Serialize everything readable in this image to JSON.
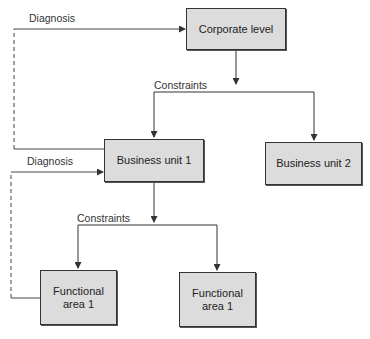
{
  "diagram": {
    "nodes": [
      {
        "id": "corporate",
        "label": "Corporate level"
      },
      {
        "id": "bu1",
        "label": "Business unit 1"
      },
      {
        "id": "bu2",
        "label": "Business unit 2"
      },
      {
        "id": "fa1",
        "label": "Functional\narea 1"
      },
      {
        "id": "fa2",
        "label": "Functional\narea 1"
      }
    ],
    "labels": {
      "diagnosis_top": "Diagnosis",
      "constraints_top": "Constraints",
      "diagnosis_mid": "Diagnosis",
      "constraints_mid": "Constraints"
    },
    "edges": [
      {
        "from": "corporate",
        "to": "bu1",
        "label": "Constraints",
        "style": "solid"
      },
      {
        "from": "corporate",
        "to": "bu2",
        "label": "Constraints",
        "style": "solid"
      },
      {
        "from": "bu1",
        "to": "corporate",
        "label": "Diagnosis",
        "style": "dashed"
      },
      {
        "from": "bu1",
        "to": "fa1",
        "label": "Constraints",
        "style": "solid"
      },
      {
        "from": "bu1",
        "to": "fa2",
        "label": "Constraints",
        "style": "solid"
      },
      {
        "from": "fa1",
        "to": "bu1",
        "label": "Diagnosis",
        "style": "dashed"
      }
    ],
    "colors": {
      "box_fill": "#dcdcdc",
      "line": "#333333"
    }
  }
}
